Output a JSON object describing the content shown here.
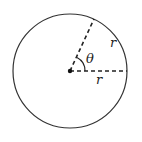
{
  "diagram": {
    "labels": {
      "theta": "θ",
      "arc": "r",
      "radius": "r"
    },
    "colors": {
      "stroke": "#333333",
      "background": "#ffffff"
    }
  }
}
